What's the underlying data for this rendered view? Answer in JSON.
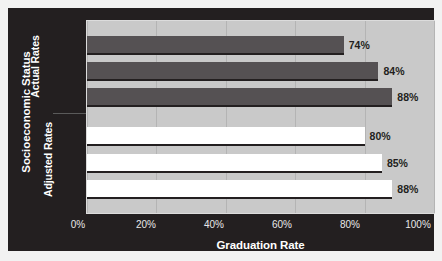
{
  "chart_data": {
    "type": "bar",
    "orientation": "horizontal",
    "title": "",
    "xlabel": "Graduation Rate",
    "ylabel": "Socioeconomic Status",
    "xlim": [
      0,
      100
    ],
    "xticks": [
      "0%",
      "20%",
      "40%",
      "60%",
      "80%",
      "100%"
    ],
    "xtick_values": [
      0,
      20,
      40,
      60,
      80,
      100
    ],
    "grid": true,
    "legend": "none",
    "groups": [
      {
        "name": "Actual Rates",
        "style": "dark",
        "categories": [
          "Low",
          "Middle",
          "High"
        ],
        "values": [
          74,
          84,
          88
        ],
        "labels": [
          "74%",
          "84%",
          "88%"
        ]
      },
      {
        "name": "Adjusted Rates",
        "style": "white",
        "categories": [
          "Low",
          "Middle",
          "High"
        ],
        "values": [
          80,
          85,
          88
        ],
        "labels": [
          "80%",
          "85%",
          "88%"
        ]
      }
    ]
  },
  "colors": {
    "panel": "#231f20",
    "plot_background": "#c9c9c9",
    "gridline": "#b4b4b4",
    "bar_actual": "#555153",
    "bar_adjusted": "#ffffff",
    "label_text": "#e8e8e8",
    "value_text": "#231f20"
  }
}
